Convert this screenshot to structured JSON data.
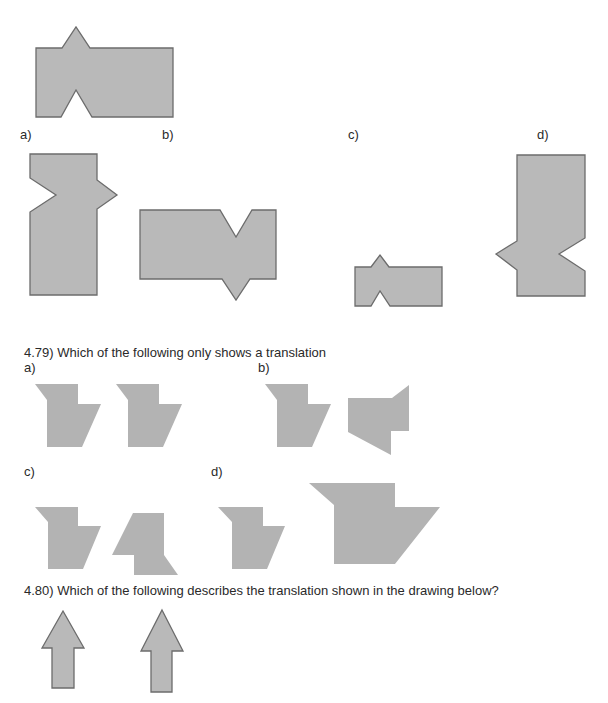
{
  "problem_478": {
    "option_labels": [
      "a)",
      "b)",
      "c)",
      "d)"
    ],
    "shapes": {
      "original": "pentagon-peak-rectangle",
      "a": "rotated-90-clockwise",
      "b": "rotated-180",
      "c": "scaled-down",
      "d": "rotated-90-counterclockwise"
    }
  },
  "problem_479": {
    "question": "4.79) Which of the following only shows a translation",
    "option_labels": [
      "a)",
      "b)",
      "c)",
      "d)"
    ]
  },
  "problem_480": {
    "question": "4.80) Which of the following describes the translation shown in the drawing below?",
    "figures": [
      "up-arrow-original",
      "up-arrow-translated"
    ]
  },
  "colors": {
    "shape_fill": "#b9b9b9",
    "shape_stroke": "#6c6c6c",
    "text": "#2a2a2a"
  }
}
